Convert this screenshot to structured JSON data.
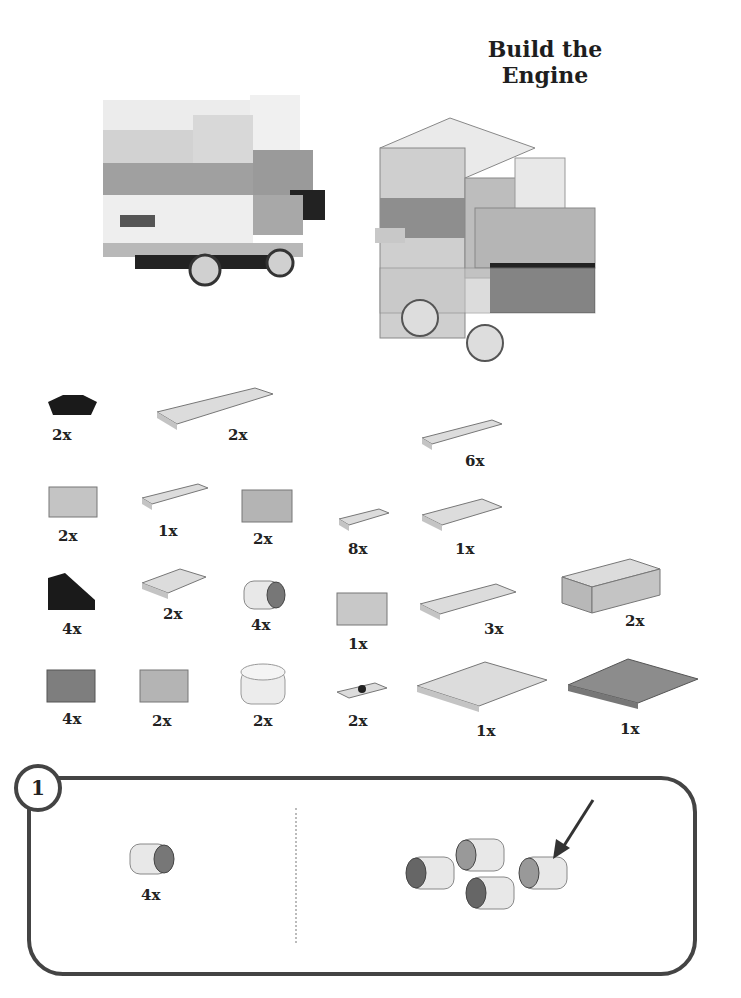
{
  "page": {
    "title": "Build the Engine"
  },
  "illustrations": {
    "photo": "assembled-engine-photo",
    "render": "assembled-engine-render"
  },
  "parts_list": [
    {
      "part": "black-wheel-holder-plate",
      "qty": "2x"
    },
    {
      "part": "plate-2x6",
      "qty": "2x"
    },
    {
      "part": "plate-1x4",
      "qty": "6x"
    },
    {
      "part": "brick-1x2",
      "qty": "2x"
    },
    {
      "part": "plate-1x3",
      "qty": "1x"
    },
    {
      "part": "brick-1x2-b",
      "qty": "2x"
    },
    {
      "part": "plate-1x2",
      "qty": "8x"
    },
    {
      "part": "plate-2x3",
      "qty": "1x"
    },
    {
      "part": "black-slope-1x2",
      "qty": "4x"
    },
    {
      "part": "plate-2x2",
      "qty": "2x"
    },
    {
      "part": "wheel",
      "qty": "4x"
    },
    {
      "part": "brick-1x2-c",
      "qty": "1x"
    },
    {
      "part": "plate-2x4",
      "qty": "3x"
    },
    {
      "part": "brick-2x4",
      "qty": "2x"
    },
    {
      "part": "dark-brick-1x2",
      "qty": "4x"
    },
    {
      "part": "brick-1x2-d",
      "qty": "2x"
    },
    {
      "part": "round-brick-2x2",
      "qty": "2x"
    },
    {
      "part": "jumper-plate-1x2",
      "qty": "2x"
    },
    {
      "part": "plate-4x6",
      "qty": "1x"
    },
    {
      "part": "dark-plate-4x6",
      "qty": "1x"
    }
  ],
  "step": {
    "number": "1",
    "parts_qty": "4x",
    "parts_part": "wheel"
  },
  "colors": {
    "border": "#444444",
    "light_gray": "#d8d8d8",
    "mid_gray": "#a8a8a8",
    "dark": "#1a1a1a"
  }
}
